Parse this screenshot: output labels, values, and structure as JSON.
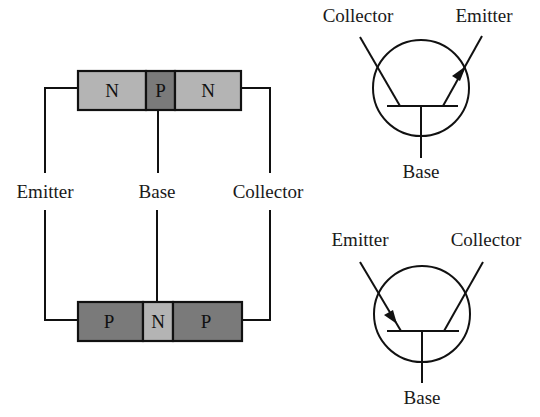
{
  "npn_structure": {
    "segments": [
      {
        "label": "N",
        "color": "#b4b4b4"
      },
      {
        "label": "P",
        "color": "#7a7a7a"
      },
      {
        "label": "N",
        "color": "#b4b4b4"
      }
    ],
    "terminals": {
      "left": "Emitter",
      "middle": "Base",
      "right": "Collector"
    }
  },
  "pnp_structure": {
    "segments": [
      {
        "label": "P",
        "color": "#7a7a7a"
      },
      {
        "label": "N",
        "color": "#b4b4b4"
      },
      {
        "label": "P",
        "color": "#7a7a7a"
      }
    ]
  },
  "npn_symbol": {
    "collector": "Collector",
    "emitter": "Emitter",
    "base": "Base"
  },
  "pnp_symbol": {
    "emitter": "Emitter",
    "collector": "Collector",
    "base": "Base"
  },
  "colors": {
    "light_segment": "#b4b4b4",
    "dark_segment": "#7a7a7a",
    "line": "#111111"
  }
}
